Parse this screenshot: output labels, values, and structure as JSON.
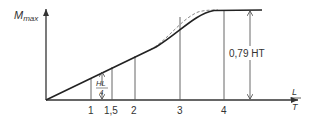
{
  "diagram": {
    "y_axis": {
      "label": "M",
      "label_sub": "max"
    },
    "x_axis": {
      "label_num": "L",
      "label_den": "T"
    },
    "ticks": [
      {
        "value": 1,
        "label": "1"
      },
      {
        "value": 1.5,
        "label": "1,5"
      },
      {
        "value": 2,
        "label": "2"
      },
      {
        "value": 3,
        "label": "3"
      },
      {
        "value": 4,
        "label": "4"
      }
    ],
    "annotation_hl4": {
      "num": "HL",
      "den": "4"
    },
    "annotation_plateau": "0,79 HT",
    "colors": {
      "line": "#222222",
      "thin": "#555555",
      "dashed": "#777777",
      "text": "#333333"
    }
  }
}
